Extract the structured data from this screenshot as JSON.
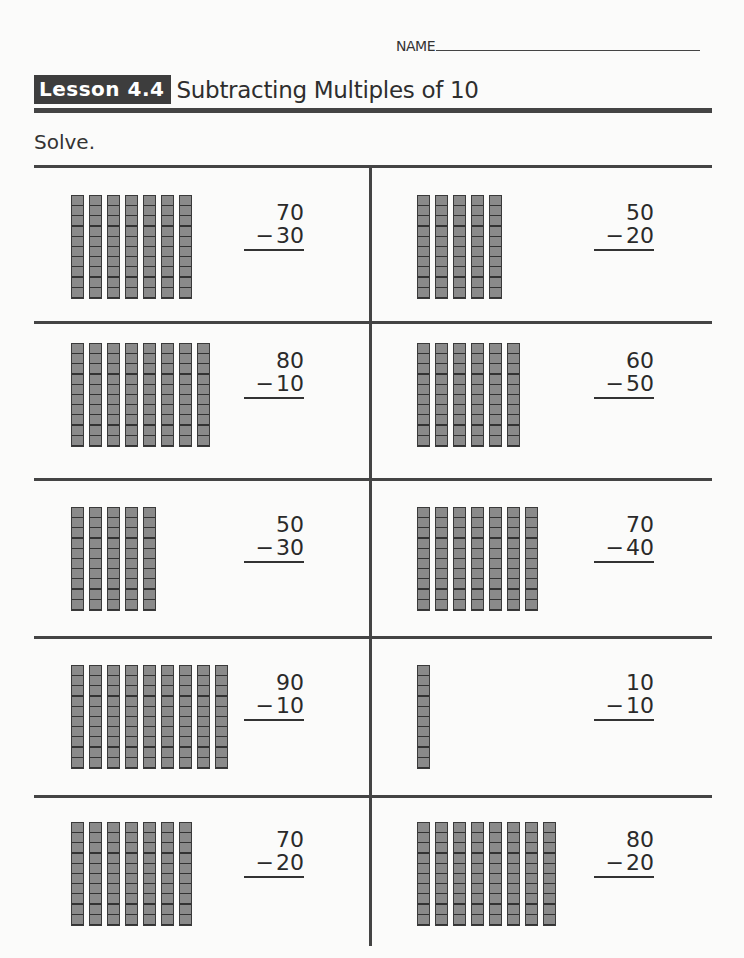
{
  "header": {
    "name_label": "NAME",
    "lesson_badge": "Lesson 4.4",
    "lesson_title": "Subtracting Multiples of 10",
    "instruction": "Solve."
  },
  "problems": [
    {
      "minuend": "70",
      "subtrahend": "30",
      "rods": 7,
      "minus": "−"
    },
    {
      "minuend": "50",
      "subtrahend": "20",
      "rods": 5,
      "minus": "−"
    },
    {
      "minuend": "80",
      "subtrahend": "10",
      "rods": 8,
      "minus": "−"
    },
    {
      "minuend": "60",
      "subtrahend": "50",
      "rods": 6,
      "minus": "−"
    },
    {
      "minuend": "50",
      "subtrahend": "30",
      "rods": 5,
      "minus": "−"
    },
    {
      "minuend": "70",
      "subtrahend": "40",
      "rods": 7,
      "minus": "−"
    },
    {
      "minuend": "90",
      "subtrahend": "10",
      "rods": 9,
      "minus": "−"
    },
    {
      "minuend": "10",
      "subtrahend": "10",
      "rods": 1,
      "minus": "−"
    },
    {
      "minuend": "70",
      "subtrahend": "20",
      "rods": 7,
      "minus": "−"
    },
    {
      "minuend": "80",
      "subtrahend": "20",
      "rods": 8,
      "minus": "−"
    }
  ],
  "colors": {
    "rod_fill": "#8a8a8a",
    "rule": "#444444",
    "badge_bg": "#3d3d3d"
  }
}
